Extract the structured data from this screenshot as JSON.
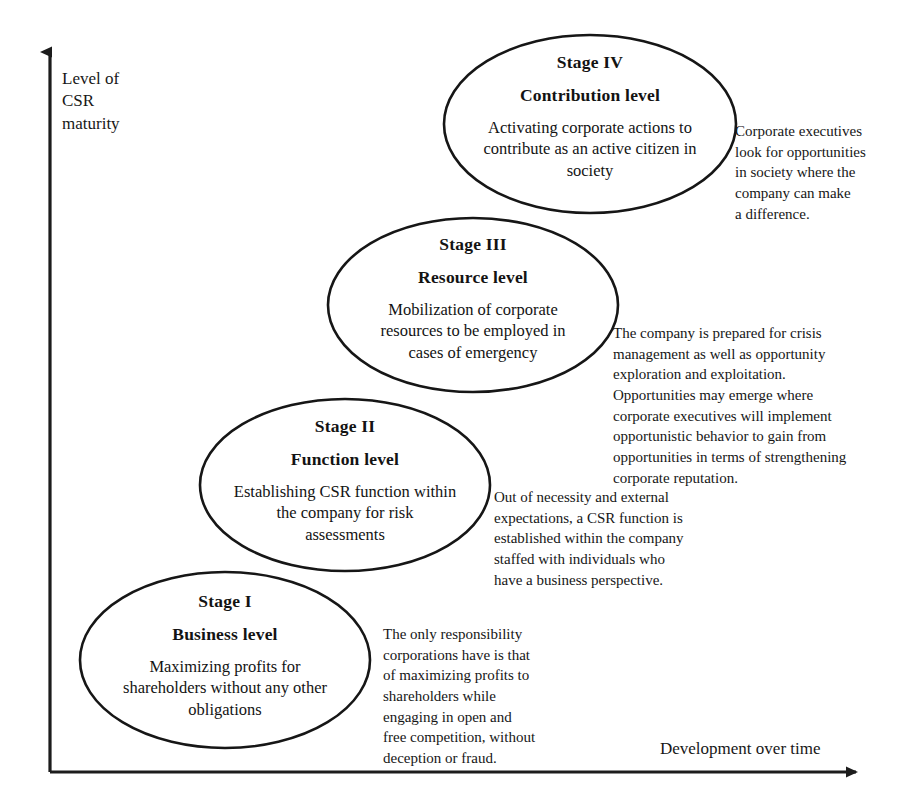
{
  "diagram": {
    "axes": {
      "y_label": "Level of\nCSR\nmaturity",
      "x_label": "Development over time",
      "line_color": "#1c1c1c"
    },
    "stages": [
      {
        "id": "stage-1",
        "number": "Stage I",
        "title": "Business level",
        "description": "Maximizing profits for\nshareholders without any other\nobligations",
        "annotation": "The only responsibility\ncorporations have is that\nof maximizing profits to\nshareholders while\nengaging in open and\nfree competition, without\ndeception or fraud."
      },
      {
        "id": "stage-2",
        "number": "Stage II",
        "title": "Function level",
        "description": "Establishing CSR function within\nthe company for risk\nassessments",
        "annotation": "Out of necessity and external\nexpectations, a CSR function is\nestablished within the company\nstaffed with individuals who\nhave a business perspective."
      },
      {
        "id": "stage-3",
        "number": "Stage III",
        "title": "Resource level",
        "description": "Mobilization of corporate\nresources to be employed in\ncases of emergency",
        "annotation": "The company is prepared for crisis\nmanagement as well as opportunity\nexploration and exploitation.\nOpportunities may emerge where\ncorporate executives will implement\nopportunistic behavior to gain from\nopportunities in terms of strengthening\ncorporate reputation."
      },
      {
        "id": "stage-4",
        "number": "Stage IV",
        "title": "Contribution level",
        "description": "Activating corporate actions to\ncontribute as an active citizen in\nsociety",
        "annotation": "Corporate executives\nlook for opportunities\nin society where the\ncompany can make\na difference."
      }
    ]
  }
}
